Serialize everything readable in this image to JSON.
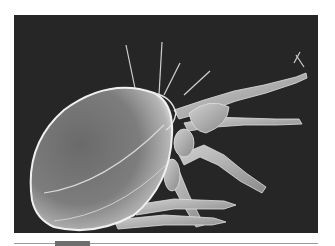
{
  "figure": {
    "subject": "Scanning electron micrograph of a mite",
    "colors": {
      "background": "#262626",
      "body_highlight": "#e6e6e6",
      "body_mid": "#8c8c8c",
      "page": "#ffffff",
      "rule": "#9a9a9a",
      "tab_block": "#6e6e6e"
    }
  }
}
